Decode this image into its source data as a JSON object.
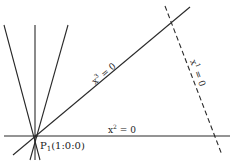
{
  "diagram": {
    "point": {
      "name": "P",
      "subscript": "1",
      "coords": "(1:0:0)",
      "x": 36,
      "y": 136
    },
    "lines": [
      {
        "id": "x2",
        "label_base": "x",
        "label_sup": "2",
        "label_rest": " = 0",
        "style": "solid",
        "x1": 4,
        "y1": 136,
        "x2": 230,
        "y2": 136
      },
      {
        "id": "x3",
        "label_base": "x",
        "label_sup": "3",
        "label_rest": " = 0",
        "style": "solid",
        "x1": 13,
        "y1": 155,
        "x2": 190,
        "y2": 7
      },
      {
        "id": "x1",
        "label_base": "x",
        "label_sup": "1",
        "label_rest": " = 0",
        "style": "dashed",
        "x1": 165,
        "y1": 6,
        "x2": 222,
        "y2": 155
      }
    ],
    "pencil_lines": [
      {
        "x1": 4,
        "y1": 25,
        "x2": 40,
        "y2": 160
      },
      {
        "x1": 35,
        "y1": 25,
        "x2": 35,
        "y2": 160
      },
      {
        "x1": 68,
        "y1": 25,
        "x2": 30,
        "y2": 160
      }
    ],
    "colors": {
      "line": "#2a2a2a",
      "background": "#ffffff"
    }
  }
}
